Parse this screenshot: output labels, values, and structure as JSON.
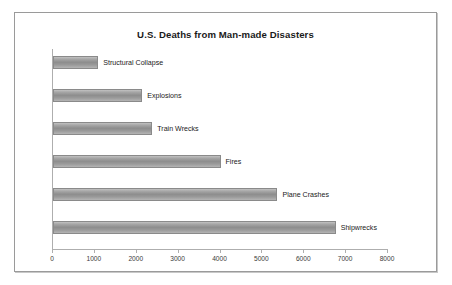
{
  "chart_data": {
    "type": "bar",
    "orientation": "horizontal",
    "title": "U.S. Deaths from Man-made Disasters",
    "xlabel": "",
    "ylabel": "",
    "xlim": [
      0,
      8000
    ],
    "xticks": [
      "0",
      "1000",
      "2000",
      "3000",
      "4000",
      "5000",
      "6000",
      "7000",
      "8000"
    ],
    "xtick_values": [
      0,
      1000,
      2000,
      3000,
      4000,
      5000,
      6000,
      7000,
      8000
    ],
    "grid": false,
    "legend": false,
    "categories": [
      "Structural Collapse",
      "Explosions",
      "Train Wrecks",
      "Fires",
      "Plane Crashes",
      "Shipwrecks"
    ],
    "values": [
      1080,
      2130,
      2370,
      4000,
      5360,
      6750
    ],
    "bar_color": "#9a9a9a",
    "bar_border_color": "#8a8a8a",
    "axis_color": "#aeaeae",
    "frame_border_color": "#9a9a9a",
    "background_color": "#ffffff",
    "title_color": "#1a1a1a"
  }
}
